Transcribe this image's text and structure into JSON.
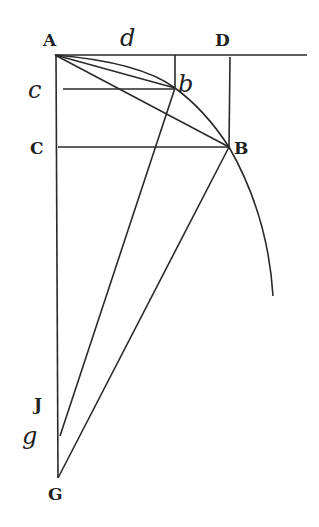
{
  "diagram": {
    "labels": {
      "A": "A",
      "d": "d",
      "D": "D",
      "c": "c",
      "b": "b",
      "C": "C",
      "B": "B",
      "J": "J",
      "g": "g",
      "G": "G"
    },
    "points": {
      "A": [
        55,
        55
      ],
      "d": [
        175,
        55
      ],
      "D": [
        230,
        55
      ],
      "b": [
        175,
        88
      ],
      "c": [
        63,
        88
      ],
      "C": [
        55,
        147
      ],
      "B": [
        229,
        147
      ],
      "J": [
        58,
        405
      ],
      "g": [
        60,
        436
      ],
      "G": [
        58,
        478
      ],
      "arc_end": [
        273,
        296
      ],
      "line_end": [
        307,
        55
      ]
    }
  }
}
